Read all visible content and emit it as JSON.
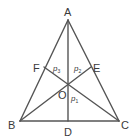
{
  "diagram": {
    "type": "triangle-cevians",
    "stroke_color": "#555555",
    "points": {
      "A": {
        "label": "A",
        "x": 68,
        "y": 20
      },
      "B": {
        "label": "B",
        "x": 20,
        "y": 121
      },
      "C": {
        "label": "C",
        "x": 119,
        "y": 121
      },
      "D": {
        "label": "D",
        "x": 68,
        "y": 121
      },
      "E": {
        "label": "E",
        "x": 91,
        "y": 67
      },
      "F": {
        "label": "F",
        "x": 44,
        "y": 67
      },
      "O": {
        "label": "O",
        "x": 68,
        "y": 84
      }
    },
    "segments": [
      [
        "A",
        "B"
      ],
      [
        "B",
        "C"
      ],
      [
        "C",
        "A"
      ],
      [
        "A",
        "D"
      ],
      [
        "B",
        "E"
      ],
      [
        "C",
        "F"
      ]
    ],
    "region_labels": {
      "p3": {
        "base": "p",
        "sub": "3"
      },
      "p2": {
        "base": "p",
        "sub": "2"
      },
      "p1": {
        "base": "p",
        "sub": "1"
      }
    }
  }
}
